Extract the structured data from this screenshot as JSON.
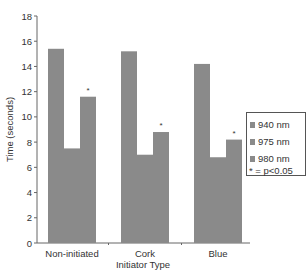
{
  "chart_data": {
    "type": "bar",
    "title": "",
    "xlabel": "Initiator Type",
    "ylabel": "Time (seconds)",
    "ylim": [
      0,
      18
    ],
    "yticks": [
      0,
      2,
      4,
      6,
      8,
      10,
      12,
      14,
      16,
      18
    ],
    "grid": false,
    "legend_position": "right",
    "categories": [
      "Non-initiated",
      "Cork",
      "Blue"
    ],
    "series": [
      {
        "name": "940 nm",
        "values": [
          15.4,
          15.2,
          14.2
        ],
        "color": "#8a8a8a"
      },
      {
        "name": "975 nm",
        "values": [
          7.5,
          7.0,
          6.8
        ],
        "color": "#8a8a8a"
      },
      {
        "name": "980 nm",
        "values": [
          11.6,
          8.8,
          8.2
        ],
        "color": "#8a8a8a",
        "significance": [
          "*",
          "*",
          "*"
        ]
      }
    ],
    "annotations": [
      "* = p<0.05"
    ]
  },
  "legend": {
    "items": [
      {
        "label": "940 nm"
      },
      {
        "label": "975 nm"
      },
      {
        "label": "980 nm"
      }
    ],
    "note": "* = p<0.05"
  },
  "axes": {
    "xlabel": "Initiator Type",
    "ylabel": "Time (seconds)",
    "star": "*"
  }
}
